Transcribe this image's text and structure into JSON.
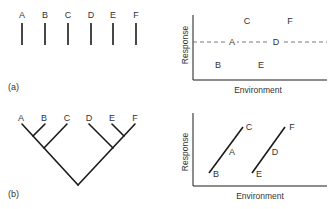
{
  "panel_a": {
    "tag": "(a)",
    "taxa": [
      "A",
      "B",
      "C",
      "D",
      "E",
      "F"
    ],
    "plot": {
      "xlabel": "Environment",
      "ylabel": "Response",
      "points": [
        {
          "label": "C",
          "pos": "high-left"
        },
        {
          "label": "F",
          "pos": "high-right"
        },
        {
          "label": "A",
          "pos": "mid-left"
        },
        {
          "label": "D",
          "pos": "mid-right"
        },
        {
          "label": "B",
          "pos": "low-left"
        },
        {
          "label": "E",
          "pos": "low-right"
        }
      ],
      "reference_line": "dashed horizontal through A and D"
    }
  },
  "panel_b": {
    "tag": "(b)",
    "taxa": [
      "A",
      "B",
      "C",
      "D",
      "E",
      "F"
    ],
    "tree": "((A,B),C),(D,(E,F))",
    "plot": {
      "xlabel": "Environment",
      "ylabel": "Response",
      "lines": [
        {
          "from": "B",
          "mid": "A",
          "to": "C"
        },
        {
          "from": "E",
          "mid": "D",
          "to": "F"
        }
      ]
    }
  },
  "colors": {
    "ink": "#1a1a1a",
    "text": "#333333",
    "background": "#ffffff"
  }
}
